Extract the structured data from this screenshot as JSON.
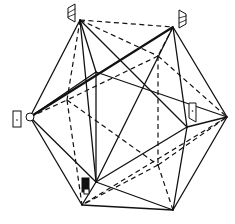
{
  "figure": {
    "type": "icosahedron-wireframe",
    "caption": "",
    "colors": {
      "line": "#111111",
      "background": "#ffffff"
    },
    "vertices": {
      "A": [
        80,
        20
      ],
      "B": [
        173,
        27
      ],
      "C": [
        30,
        117
      ],
      "D": [
        227,
        117
      ],
      "E": [
        96,
        72
      ],
      "F": [
        187,
        127
      ],
      "G": [
        96,
        182
      ],
      "H": [
        82,
        205
      ],
      "I": [
        173,
        210
      ],
      "J": [
        158,
        56
      ],
      "K": [
        158,
        165
      ],
      "L": [
        67,
        100
      ]
    },
    "markers": [
      {
        "name": "flag-top-left",
        "at": "A",
        "shape": "hatched-flag"
      },
      {
        "name": "flag-top-right",
        "at": "B",
        "shape": "hatched-flag"
      },
      {
        "name": "door-left",
        "at": "C",
        "shape": "door-with-circle"
      },
      {
        "name": "door-right",
        "at": "F",
        "shape": "door"
      },
      {
        "name": "block-bottom",
        "at": "G",
        "shape": "filled-block"
      }
    ]
  }
}
